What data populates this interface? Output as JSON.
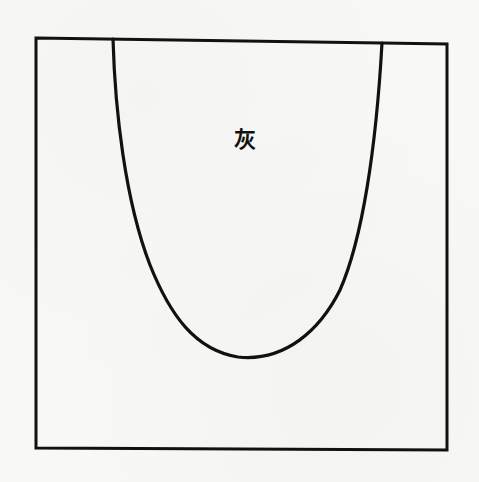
{
  "figure": {
    "label": "灰",
    "label_position": {
      "x": 245,
      "y": 139
    },
    "frame": {
      "x1": 36,
      "y1": 38,
      "x2": 447,
      "y2": 450
    },
    "curve": {
      "left_top": {
        "x": 113,
        "y": 39
      },
      "bottom": {
        "x": 238,
        "y": 357
      },
      "right_top": {
        "x": 382,
        "y": 43
      }
    },
    "stroke_color": "#111111",
    "background_color": "#f8f8f6"
  }
}
